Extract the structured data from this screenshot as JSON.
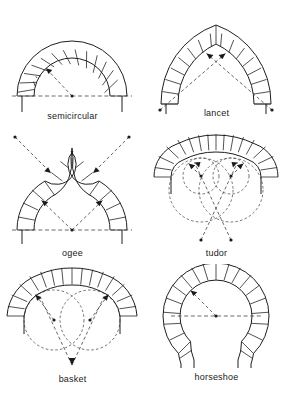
{
  "figure": {
    "title": "",
    "type": "diagram",
    "background_color": "#ffffff",
    "line_color": "#262626",
    "construction_line_color": "#333333",
    "width": 289,
    "height": 395,
    "columns": 2,
    "rows": 3
  },
  "arches": [
    {
      "id": "semicircular",
      "label": "semicircular",
      "row": 1,
      "column": 1,
      "centers": 1,
      "description": "half-round arch struck from a single centre on the springing line",
      "construction": "one radius arrow from centre point to intrados",
      "springing_line": true,
      "voussoirs": 19
    },
    {
      "id": "lancet",
      "label": "lancet",
      "row": 1,
      "column": 2,
      "centers": 2,
      "description": "tall sharply pointed two-centred arch",
      "construction": "two radii crossing, centres outside the span",
      "springing_line": false,
      "voussoirs": 24
    },
    {
      "id": "ogee",
      "label": "ogee",
      "row": 2,
      "column": 1,
      "centers": 4,
      "description": "double-curved arch, concave above convex, rising to a point",
      "construction": "two inner radii from a centre on the springing line and two outer radii from centres above",
      "springing_line": true,
      "voussoirs": 8
    },
    {
      "id": "tudor",
      "label": "tudor",
      "row": 2,
      "column": 2,
      "centers": 4,
      "description": "flattened four-centred arch",
      "construction": "two small circles near the springing and two large circles struck from centres below the springing line",
      "springing_line": false,
      "voussoirs": 23
    },
    {
      "id": "basket",
      "label": "basket",
      "row": 3,
      "column": 1,
      "centers": 3,
      "description": "three-centred basket-handle arch, flattened crown",
      "construction": "two side circles plus radii converging to a low centre point",
      "springing_line": false,
      "voussoirs": 23
    },
    {
      "id": "horseshoe",
      "label": "horseshoe",
      "row": 3,
      "column": 2,
      "centers": 1,
      "description": "arc greater than a semicircle, narrowing below the springing line",
      "construction": "one radius arrow from the raised centre point",
      "springing_line": true,
      "voussoirs": 22
    }
  ]
}
